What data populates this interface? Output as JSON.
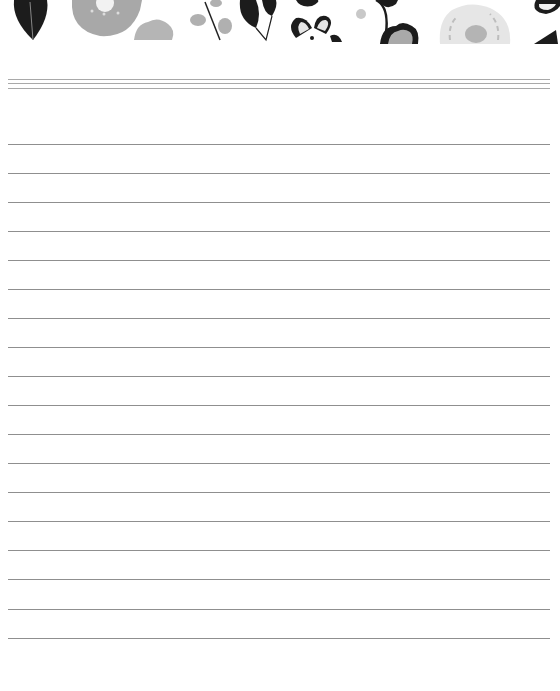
{
  "page": {
    "type": "lined-notepaper",
    "background": "#ffffff",
    "header_motif": "floral-grayscale-banner",
    "header_colors": {
      "dark": "#1c1c1c",
      "mid": "#a3a3a3",
      "light": "#d4d4d4"
    },
    "header_double_rules_y": [
      79,
      83,
      88
    ],
    "writing_lines_y": [
      144,
      173,
      202,
      231,
      260,
      289,
      318,
      347,
      376,
      405,
      434,
      463,
      492,
      521,
      550,
      579,
      609,
      638
    ],
    "line_color": "#8f8f8f",
    "line_left": 8,
    "line_right": 550
  }
}
